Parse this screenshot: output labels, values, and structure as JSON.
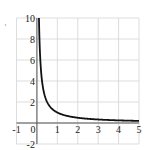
{
  "chart_data": {
    "type": "line",
    "title": "",
    "xlabel": "",
    "ylabel": "",
    "function": "y = 1/x",
    "xlim": [
      -1,
      5
    ],
    "ylim": [
      -2,
      10
    ],
    "grid": true,
    "x_ticks": [
      -1,
      0,
      1,
      2,
      3,
      4,
      5
    ],
    "y_ticks": [
      -2,
      2,
      4,
      6,
      8,
      10
    ],
    "x_tick_labels": [
      "-1",
      "0",
      "1",
      "2",
      "3",
      "4",
      "5"
    ],
    "y_tick_labels": [
      "-2",
      "2",
      "4",
      "6",
      "8",
      "10"
    ],
    "series": [
      {
        "name": "y = 1/x",
        "x": [
          0.1,
          0.125,
          0.15,
          0.2,
          0.25,
          0.3,
          0.4,
          0.5,
          0.75,
          1,
          1.5,
          2,
          2.5,
          3,
          3.5,
          4,
          4.5,
          5
        ],
        "y": [
          10,
          8,
          6.67,
          5,
          4,
          3.33,
          2.5,
          2,
          1.33,
          1,
          0.67,
          0.5,
          0.4,
          0.33,
          0.29,
          0.25,
          0.22,
          0.2
        ]
      }
    ],
    "colors": {
      "curve": "#111111",
      "grid": "#d4d4d4",
      "axis": "#555555",
      "label": "#222222"
    }
  }
}
